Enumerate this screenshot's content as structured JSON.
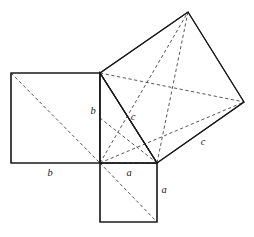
{
  "figure": {
    "name": "pythagorean-theorem-dissection-diagram",
    "type": "geometric-diagram",
    "canvas": {
      "width": 254,
      "height": 237
    },
    "colors": {
      "background": "#ffffff",
      "solid_stroke": "#1a1a1a",
      "dashed_stroke": "#2b2b2b",
      "label": "#1a1a1a"
    },
    "points": {
      "right_angle_vertex": {
        "x": 100,
        "y": 163
      },
      "triangle_top_vertex": {
        "x": 100,
        "y": 73
      },
      "triangle_right_vertex": {
        "x": 157,
        "y": 163
      },
      "b_square_top_left": {
        "x": 11,
        "y": 73
      },
      "b_square_bottom_left": {
        "x": 11,
        "y": 163
      },
      "a_square_bottom_left": {
        "x": 100,
        "y": 222
      },
      "a_square_bottom_right": {
        "x": 157,
        "y": 222
      },
      "c_square_top": {
        "x": 188,
        "y": 12
      },
      "c_square_right": {
        "x": 244,
        "y": 102
      }
    },
    "squares": [
      {
        "name": "square-on-leg-b",
        "label": "b",
        "vertices": "11,73 100,73 100,163 11,163"
      },
      {
        "name": "square-on-leg-a",
        "label": "a",
        "vertices": "100,163 157,163 157,222 100,222"
      },
      {
        "name": "square-on-hypotenuse-c",
        "label": "c",
        "vertices": "100,73 188,12 244,102 157,163"
      }
    ],
    "triangle": {
      "name": "right-triangle",
      "vertices": "100,73 157,163 100,163",
      "legs": [
        "a",
        "b"
      ],
      "hypotenuse": "c"
    },
    "dashed_lines": [
      {
        "name": "b-square-diagonal",
        "x1": 11,
        "y1": 73,
        "x2": 100,
        "y2": 163
      },
      {
        "name": "c-square-diagonal-top-to-bottom",
        "x1": 188,
        "y1": 12,
        "x2": 157,
        "y2": 163
      },
      {
        "name": "c-square-diagonal-left-to-right",
        "x1": 100,
        "y1": 73,
        "x2": 244,
        "y2": 102
      },
      {
        "name": "a-square-diagonal",
        "x1": 100,
        "y1": 163,
        "x2": 157,
        "y2": 222
      },
      {
        "name": "cevian-vertex-to-c-top",
        "x1": 100,
        "y1": 163,
        "x2": 188,
        "y2": 12
      },
      {
        "name": "cevian-vertex-to-c-right",
        "x1": 100,
        "y1": 163,
        "x2": 244,
        "y2": 102
      },
      {
        "name": "cevian-vertex-to-triangle-right",
        "x1": 100,
        "y1": 163,
        "x2": 157,
        "y2": 163
      },
      {
        "name": "cevian-triangle-right-to-b-top",
        "x1": 157,
        "y1": 163,
        "x2": 100,
        "y2": 73
      },
      {
        "name": "cevian-triangle-right-to-b-mid",
        "x1": 157,
        "y1": 163,
        "x2": 100,
        "y2": 118
      },
      {
        "name": "cevian-triangle-right-to-vertex",
        "x1": 157,
        "y1": 163,
        "x2": 100,
        "y2": 163
      }
    ],
    "labels": [
      {
        "name": "label-b-vertical",
        "text": "b",
        "x": 93,
        "y": 112
      },
      {
        "name": "label-b-horizontal",
        "text": "b",
        "x": 50,
        "y": 174
      },
      {
        "name": "label-c-hypotenuse",
        "text": "c",
        "x": 133,
        "y": 118
      },
      {
        "name": "label-c-outer",
        "text": "c",
        "x": 203,
        "y": 143
      },
      {
        "name": "label-a-horizontal",
        "text": "a",
        "x": 129,
        "y": 174
      },
      {
        "name": "label-a-vertical",
        "text": "a",
        "x": 164,
        "y": 191
      }
    ]
  }
}
